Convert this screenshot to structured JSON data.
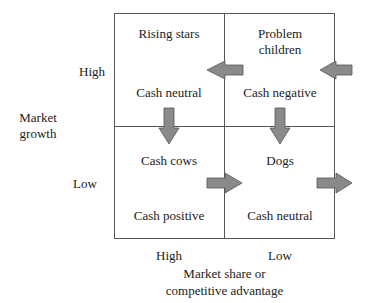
{
  "diagram": {
    "type": "growth-share matrix",
    "y_axis": {
      "title_line1": "Market",
      "title_line2": "growth",
      "high": "High",
      "low": "Low"
    },
    "x_axis": {
      "title_line1": "Market share or",
      "title_line2": "competitive advantage",
      "high": "High",
      "low": "Low"
    },
    "quadrants": [
      {
        "position": "top-left",
        "name": "Rising stars",
        "cash": "Cash neutral"
      },
      {
        "position": "top-right",
        "name_line1": "Problem",
        "name_line2": "children",
        "cash": "Cash negative"
      },
      {
        "position": "bottom-left",
        "name": "Cash cows",
        "cash": "Cash positive"
      },
      {
        "position": "bottom-right",
        "name": "Dogs",
        "cash": "Cash neutral"
      }
    ],
    "arrows": [
      {
        "from": "outside-right",
        "to": "Problem children",
        "direction": "left"
      },
      {
        "from": "Problem children",
        "to": "Rising stars",
        "direction": "left"
      },
      {
        "from": "Rising stars",
        "to": "Cash cows",
        "direction": "down"
      },
      {
        "from": "Problem children",
        "to": "Dogs",
        "direction": "down"
      },
      {
        "from": "Cash cows",
        "to": "Dogs",
        "direction": "right"
      },
      {
        "from": "Dogs",
        "to": "outside-right",
        "direction": "right"
      }
    ],
    "colors": {
      "arrow_fill": "#8a8a8a",
      "arrow_stroke": "#555555",
      "grid_line": "#555555"
    }
  }
}
